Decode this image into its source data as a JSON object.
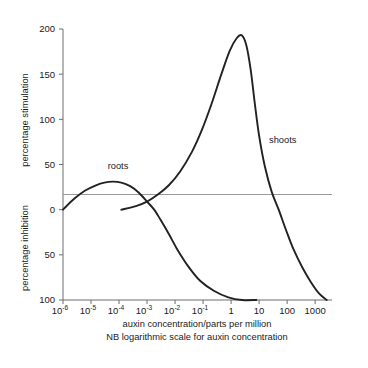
{
  "chart_data": {
    "type": "line",
    "title": "",
    "xlabel": "auxin concentration/parts per million",
    "xnote": "NB logarithmic scale for auxin concentration",
    "ylabel_upper": "percentage stimulation",
    "ylabel_lower": "percentage inhibition",
    "xscale": "log",
    "xlim": [
      1e-06,
      4000
    ],
    "ylim": [
      -100,
      200
    ],
    "grid": false,
    "legend": "inline-labels",
    "xticks": [
      {
        "value": 1e-06,
        "label": "10",
        "exponent": "-6"
      },
      {
        "value": 1e-05,
        "label": "10",
        "exponent": "-5"
      },
      {
        "value": 0.0001,
        "label": "10",
        "exponent": "-4"
      },
      {
        "value": 0.001,
        "label": "10",
        "exponent": "-3"
      },
      {
        "value": 0.01,
        "label": "10",
        "exponent": "-2"
      },
      {
        "value": 0.1,
        "label": "10",
        "exponent": "-1"
      },
      {
        "value": 1,
        "label": "1",
        "exponent": ""
      },
      {
        "value": 10,
        "label": "10",
        "exponent": ""
      },
      {
        "value": 100,
        "label": "100",
        "exponent": ""
      },
      {
        "value": 1000,
        "label": "1000",
        "exponent": ""
      }
    ],
    "yticks": [
      {
        "value": 200,
        "label": "200"
      },
      {
        "value": 150,
        "label": "150"
      },
      {
        "value": 100,
        "label": "100"
      },
      {
        "value": 50,
        "label": "50"
      },
      {
        "value": 0,
        "label": "0"
      },
      {
        "value": -50,
        "label": "50"
      },
      {
        "value": -100,
        "label": "100"
      }
    ],
    "series": [
      {
        "name": "roots",
        "label": "roots",
        "color": "#222222",
        "points": [
          [
            1e-06,
            0
          ],
          [
            2.5e-06,
            12
          ],
          [
            6e-06,
            21
          ],
          [
            1.5e-05,
            27
          ],
          [
            3e-05,
            30
          ],
          [
            6e-05,
            31
          ],
          [
            0.00012,
            30
          ],
          [
            0.00025,
            26
          ],
          [
            0.0005,
            19
          ],
          [
            0.001,
            9
          ],
          [
            0.0018,
            0
          ],
          [
            0.003,
            -11
          ],
          [
            0.006,
            -27
          ],
          [
            0.012,
            -44
          ],
          [
            0.03,
            -63
          ],
          [
            0.08,
            -79
          ],
          [
            0.25,
            -90
          ],
          [
            0.8,
            -97
          ],
          [
            2.5,
            -100
          ],
          [
            8,
            -100
          ]
        ]
      },
      {
        "name": "shoots",
        "label": "shoots",
        "color": "#222222",
        "points": [
          [
            0.00012,
            0
          ],
          [
            0.0004,
            4
          ],
          [
            0.001,
            9
          ],
          [
            0.0025,
            17
          ],
          [
            0.006,
            27
          ],
          [
            0.015,
            42
          ],
          [
            0.04,
            64
          ],
          [
            0.09,
            88
          ],
          [
            0.2,
            117
          ],
          [
            0.45,
            150
          ],
          [
            0.9,
            176
          ],
          [
            1.6,
            190
          ],
          [
            2.4,
            193
          ],
          [
            3.5,
            182
          ],
          [
            5,
            155
          ],
          [
            7,
            118
          ],
          [
            10,
            82
          ],
          [
            16,
            48
          ],
          [
            28,
            20
          ],
          [
            50,
            0
          ],
          [
            90,
            -22
          ],
          [
            170,
            -44
          ],
          [
            350,
            -64
          ],
          [
            700,
            -80
          ],
          [
            1400,
            -93
          ],
          [
            2600,
            -100
          ]
        ]
      }
    ]
  },
  "labels": {
    "roots_annotation": "roots",
    "shoots_annotation": "shoots"
  }
}
